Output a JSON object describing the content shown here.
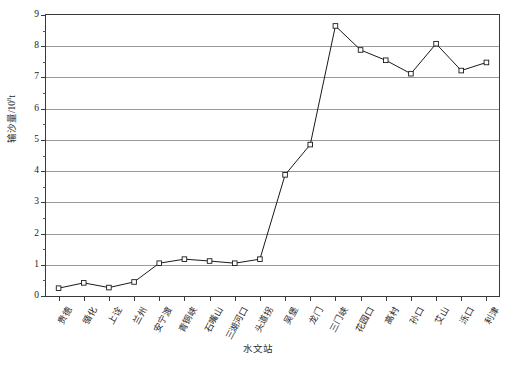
{
  "chart_data": {
    "type": "line",
    "title": "",
    "xlabel": "水文站",
    "ylabel": "输沙量/10⁸t",
    "ylabel_main": "输沙量/10",
    "ylabel_exp": "8",
    "ylabel_unit": "t",
    "categories": [
      "贵德",
      "循化",
      "上诠",
      "兰州",
      "安宁渡",
      "青铜峡",
      "石嘴山",
      "三湖河口",
      "头道拐",
      "吴堡",
      "龙门",
      "三门峡",
      "花园口",
      "高村",
      "孙口",
      "艾山",
      "泺口",
      "利津"
    ],
    "values": [
      0.25,
      0.42,
      0.27,
      0.45,
      1.05,
      1.18,
      1.12,
      1.05,
      1.18,
      3.88,
      4.85,
      8.65,
      7.88,
      7.55,
      7.12,
      8.08,
      7.22,
      7.48
    ],
    "series": [
      {
        "name": "输沙量",
        "values": [
          0.25,
          0.42,
          0.27,
          0.45,
          1.05,
          1.18,
          1.12,
          1.05,
          1.18,
          3.88,
          4.85,
          8.65,
          7.88,
          7.55,
          7.12,
          8.08,
          7.22,
          7.48
        ]
      }
    ],
    "ylim": [
      0,
      9
    ],
    "ytick_labels": [
      "0",
      "1",
      "2",
      "3",
      "4",
      "5",
      "6",
      "7",
      "8",
      "9"
    ],
    "ytick_values": [
      0,
      1,
      2,
      3,
      4,
      5,
      6,
      7,
      8,
      9
    ],
    "yminor_step": 0.5,
    "grid": "horizontal",
    "legend": "none",
    "marker": "open-square",
    "line_color": "#1a1a1a",
    "grid_color": "#9a9a9a",
    "axis_color": "#3a3a3a"
  }
}
